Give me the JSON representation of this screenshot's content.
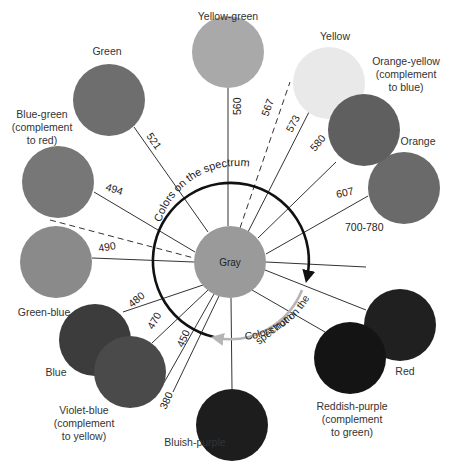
{
  "center": {
    "label": "Gray",
    "color": "#9a9a9a",
    "cx": 230,
    "cy": 262,
    "r": 36
  },
  "arcs": {
    "on_spectrum": {
      "label": "Colors on the spectrum",
      "color": "#111111"
    },
    "not_on_spectrum": {
      "label_line1": "Colors not on the",
      "label_line2": "spectrum",
      "color": "#b5b5b5"
    }
  },
  "swatches": [
    {
      "id": "yellow-green",
      "label": [
        "Yellow-green"
      ],
      "color": "#a9a9a9",
      "cx": 228,
      "cy": 52
    },
    {
      "id": "green",
      "label": [
        "Green"
      ],
      "color": "#6e6e6e",
      "cx": 109,
      "cy": 100
    },
    {
      "id": "yellow",
      "label": [
        "Yellow"
      ],
      "color": "#e9e9e9",
      "cx": 329,
      "cy": 83
    },
    {
      "id": "orange-yellow",
      "label": [
        "Orange-yellow",
        "(complement",
        "to blue)"
      ],
      "color": "#5f5f5f",
      "cx": 364,
      "cy": 130
    },
    {
      "id": "orange",
      "label": [
        "Orange"
      ],
      "color": "#6a6a6a",
      "cx": 404,
      "cy": 188
    },
    {
      "id": "blue-green",
      "label": [
        "Blue-green",
        "(complement",
        "to red)"
      ],
      "color": "#777777",
      "cx": 58,
      "cy": 182
    },
    {
      "id": "green-blue",
      "label": [
        "Green-blue"
      ],
      "color": "#8a8a8a",
      "cx": 56,
      "cy": 262
    },
    {
      "id": "red",
      "label": [
        "Red"
      ],
      "color": "#202020",
      "cx": 400,
      "cy": 325
    },
    {
      "id": "blue",
      "label": [
        "Blue"
      ],
      "color": "#3c3c3c",
      "cx": 95,
      "cy": 340
    },
    {
      "id": "violet-blue",
      "label": [
        "Violet-blue",
        "(complement",
        "to yellow)"
      ],
      "color": "#4a4a4a",
      "cx": 130,
      "cy": 372
    },
    {
      "id": "bluish-purple",
      "label": [
        "Bluish-purple"
      ],
      "color": "#1d1d1d",
      "cx": 232,
      "cy": 425
    },
    {
      "id": "reddish-purple",
      "label": [
        "Reddish-purple",
        "(complement",
        "to green)"
      ],
      "color": "#141414",
      "cx": 350,
      "cy": 358
    }
  ],
  "wavelengths": [
    "521",
    "560",
    "567",
    "573",
    "580",
    "607",
    "700-780",
    "494",
    "490",
    "480",
    "470",
    "450",
    "380"
  ]
}
